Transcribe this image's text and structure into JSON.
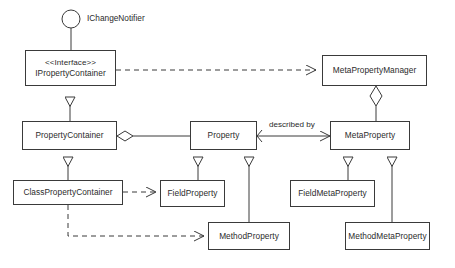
{
  "diagram": {
    "kind": "uml-class-diagram",
    "background": "#ffffff",
    "stroke": "#3a3a3a",
    "text_color": "#2b2b2b",
    "provided_interface": {
      "name": "lollipop-interface",
      "label": "IChangeNotifier"
    },
    "classes": [
      {
        "id": "ipropertycontainer",
        "stereotype": "<<Interface>>",
        "name": "IPropertyContainer"
      },
      {
        "id": "metapropertymanager",
        "name": "MetaPropertyManager"
      },
      {
        "id": "propertycontainer",
        "name": "PropertyContainer"
      },
      {
        "id": "property",
        "name": "Property"
      },
      {
        "id": "metaproperty",
        "name": "MetaProperty"
      },
      {
        "id": "classpropertycontainer",
        "name": "ClassPropertyContainer"
      },
      {
        "id": "fieldproperty",
        "name": "FieldProperty"
      },
      {
        "id": "fieldmetaproperty",
        "name": "FieldMetaProperty"
      },
      {
        "id": "methodproperty",
        "name": "MethodProperty"
      },
      {
        "id": "methodmetaproperty",
        "name": "MethodMetaProperty"
      }
    ],
    "relationships": [
      {
        "from": "ipropertycontainer",
        "to": "metapropertymanager",
        "type": "dependency",
        "label": ""
      },
      {
        "from": "propertycontainer",
        "to": "ipropertycontainer",
        "type": "generalization",
        "label": ""
      },
      {
        "from": "propertycontainer",
        "to": "property",
        "type": "aggregation",
        "label": ""
      },
      {
        "from": "metapropertymanager",
        "to": "metaproperty",
        "type": "aggregation",
        "label": ""
      },
      {
        "from": "property",
        "to": "metaproperty",
        "type": "association",
        "label": "described by"
      },
      {
        "from": "classpropertycontainer",
        "to": "propertycontainer",
        "type": "generalization",
        "label": ""
      },
      {
        "from": "fieldproperty",
        "to": "property",
        "type": "generalization",
        "label": ""
      },
      {
        "from": "methodproperty",
        "to": "property",
        "type": "generalization",
        "label": ""
      },
      {
        "from": "fieldmetaproperty",
        "to": "metaproperty",
        "type": "generalization",
        "label": ""
      },
      {
        "from": "methodmetaproperty",
        "to": "metaproperty",
        "type": "generalization",
        "label": ""
      },
      {
        "from": "classpropertycontainer",
        "to": "fieldproperty",
        "type": "dependency",
        "label": ""
      },
      {
        "from": "classpropertycontainer",
        "to": "methodproperty",
        "type": "dependency",
        "label": ""
      }
    ],
    "edge_labels": {
      "described_by": "described by"
    }
  }
}
